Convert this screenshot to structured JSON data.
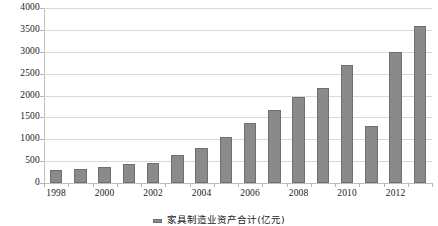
{
  "chart_data": {
    "type": "bar",
    "title": "",
    "subtitle": "",
    "xlabel": "",
    "ylabel": "",
    "ylim": [
      0,
      4000
    ],
    "ytick_step": 500,
    "yticks": [
      0,
      500,
      1000,
      1500,
      2000,
      2500,
      3000,
      3500,
      4000
    ],
    "ytick_labels": [
      "0",
      "500",
      "1000",
      "1500",
      "2000",
      "2500",
      "3000",
      "3500",
      "4000"
    ],
    "grid": true,
    "legend_position": "bottom",
    "bar_color": "#8a8a8a",
    "bar_border_color": "#6f6f6f",
    "gridline_color": "#d9d9d9",
    "axis_color": "#b5b5b5",
    "categories": [
      "1998",
      "1999",
      "2000",
      "2001",
      "2002",
      "2003",
      "2004",
      "2005",
      "2006",
      "2007",
      "2008",
      "2009",
      "2010",
      "2011",
      "2012",
      "2013"
    ],
    "xtick_labels_shown": [
      "1998",
      "2000",
      "2002",
      "2004",
      "2006",
      "2008",
      "2010",
      "2012"
    ],
    "series": [
      {
        "name": "家具制造业资产合计(亿元)",
        "values": [
          290,
          310,
          360,
          430,
          460,
          640,
          800,
          1050,
          1380,
          1680,
          1960,
          2180,
          2700,
          1300,
          3000,
          3600
        ]
      }
    ],
    "legend": [
      "家具制造业资产合计(亿元)"
    ]
  }
}
